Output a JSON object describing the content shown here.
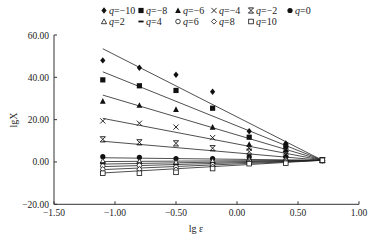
{
  "chart_data": {
    "type": "scatter",
    "title": "",
    "xlabel": "lg ε",
    "ylabel": "lgX",
    "xlim": [
      -1.5,
      1.0
    ],
    "ylim": [
      -20,
      60
    ],
    "xticks": [
      "-1.50",
      "-1.00",
      "-0.50",
      "0.00",
      "0.50",
      "1.00"
    ],
    "xtick_values": [
      -1.5,
      -1.0,
      -0.5,
      0.0,
      0.5,
      1.0
    ],
    "yticks": [
      "-20.00",
      "0.00",
      "20.00",
      "40.00",
      "60.00"
    ],
    "ytick_values": [
      -20,
      0,
      20,
      40,
      60
    ],
    "grid": false,
    "legend_position": "top",
    "x": [
      -1.1,
      -0.8,
      -0.5,
      -0.2,
      0.1,
      0.4,
      0.7
    ],
    "series": [
      {
        "name": "q=-10",
        "q": "-10",
        "marker": "diamond-filled",
        "values": [
          48.0,
          44.5,
          41.2,
          33.2,
          14.5,
          8.7,
          0.8
        ],
        "fit": [
          53.5,
          0.8
        ]
      },
      {
        "name": "q=-8",
        "q": "-8",
        "marker": "square-filled",
        "values": [
          38.8,
          36.0,
          33.8,
          25.4,
          11.7,
          7.4,
          0.8
        ],
        "fit": [
          42.6,
          0.8
        ]
      },
      {
        "name": "q=-6",
        "q": "-6",
        "marker": "triangle-filled",
        "values": [
          28.8,
          26.8,
          24.9,
          16.5,
          8.4,
          6.0,
          0.8
        ],
        "fit": [
          31.6,
          0.8
        ]
      },
      {
        "name": "q=-4",
        "q": "-4",
        "marker": "x",
        "values": [
          19.4,
          18.3,
          16.5,
          11.5,
          6.5,
          4.7,
          0.8
        ],
        "fit": [
          20.6,
          0.8
        ]
      },
      {
        "name": "q=-2",
        "q": "-2",
        "marker": "asterisk",
        "values": [
          10.7,
          9.3,
          8.8,
          6.5,
          4.9,
          3.6,
          0.8
        ],
        "fit": [
          9.8,
          0.8
        ]
      },
      {
        "name": "q=0",
        "q": "0",
        "marker": "circle-filled",
        "values": [
          2.5,
          2.2,
          1.6,
          1.6,
          2.4,
          2.5,
          0.8
        ],
        "fit": [
          2.0,
          0.8
        ]
      },
      {
        "name": "q=2",
        "q": "2",
        "marker": "triangle-open",
        "values": [
          0.5,
          0.3,
          -0.1,
          0.5,
          1.3,
          1.3,
          0.8
        ],
        "fit": [
          0.2,
          0.8
        ]
      },
      {
        "name": "q=4",
        "q": "4",
        "marker": "dash",
        "values": [
          -0.6,
          -0.6,
          -1.2,
          -0.4,
          0.8,
          0.8,
          0.8
        ],
        "fit": [
          -1.0,
          0.8
        ]
      },
      {
        "name": "q=6",
        "q": "6",
        "marker": "circle-open",
        "values": [
          -1.9,
          -1.6,
          -2.4,
          -1.3,
          0.3,
          0.4,
          0.8
        ],
        "fit": [
          -2.2,
          0.8
        ]
      },
      {
        "name": "q=8",
        "q": "8",
        "marker": "diamond-open",
        "values": [
          -3.4,
          -3.4,
          -3.6,
          -2.2,
          -0.3,
          -0.1,
          0.8
        ],
        "fit": [
          -3.6,
          0.8
        ]
      },
      {
        "name": "q=10",
        "q": "10",
        "marker": "square-open",
        "values": [
          -5.3,
          -5.3,
          -4.9,
          -3.1,
          -0.8,
          -0.6,
          0.8
        ],
        "fit": [
          -5.2,
          0.8
        ]
      }
    ],
    "fit_lines_x_range": [
      -1.1,
      0.7
    ],
    "colors": {
      "axis": "#333333",
      "marker": "#111111",
      "line": "#222222"
    }
  }
}
